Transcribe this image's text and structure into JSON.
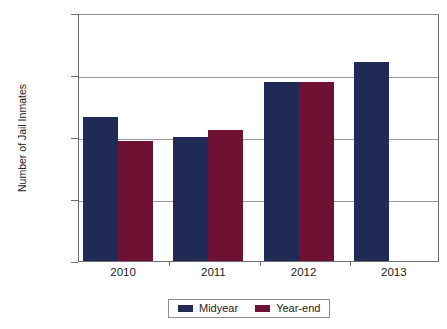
{
  "chart_data": {
    "type": "bar",
    "title": "",
    "xlabel": "",
    "ylabel": "Number of Jail Inmates",
    "categories": [
      "2010",
      "2011",
      "2012",
      "2013"
    ],
    "series": [
      {
        "name": "Midyear",
        "color": "#1f2b55",
        "values": [
          73200,
          70000,
          78900,
          82100
        ]
      },
      {
        "name": "Year-end",
        "color": "#6e1133",
        "values": [
          69400,
          71100,
          78900,
          null
        ]
      }
    ],
    "ylim": [
      50000,
      90000
    ],
    "yticks": [
      50000,
      60000,
      70000,
      80000,
      90000
    ],
    "ytick_labels": [
      "50,000",
      "60,000",
      "70,000",
      "80,000",
      "90,000"
    ],
    "grid": true,
    "legend_position": "bottom"
  },
  "legend": {
    "entries": [
      {
        "label": "Midyear",
        "color": "#1f2b55"
      },
      {
        "label": "Year-end",
        "color": "#6e1133"
      }
    ]
  }
}
